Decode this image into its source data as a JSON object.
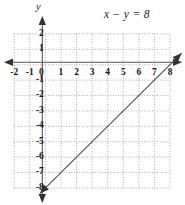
{
  "figure": {
    "equation_label": "x − y = 8",
    "equation_parts": {
      "lhs_x": "x",
      "operator": "−",
      "lhs_y": "y",
      "equals": "=",
      "rhs": "8"
    },
    "y_axis_name": "y",
    "x_axis_name": ""
  },
  "chart_data": {
    "type": "line",
    "title": "",
    "subtitle": "",
    "xlabel": "",
    "ylabel": "y",
    "annotations": [
      "x − y = 8"
    ],
    "legend": [],
    "legend_position": "none",
    "grid": true,
    "grid_style": "dotted",
    "xlim": [
      -2,
      8
    ],
    "ylim": [
      -8,
      2
    ],
    "xticks": [
      -2,
      -1,
      0,
      1,
      2,
      3,
      4,
      5,
      6,
      7,
      8
    ],
    "xtick_labels": [
      "-2",
      "-1",
      "0",
      "1",
      "2",
      "3",
      "4",
      "5",
      "6",
      "7",
      "8"
    ],
    "yticks": [
      2,
      1,
      -1,
      -2,
      -3,
      -4,
      -5,
      -6,
      -7,
      -8
    ],
    "ytick_labels": [
      "2",
      "1",
      "-1",
      "-2",
      "-3",
      "-4",
      "-5",
      "-6",
      "-7",
      "-8"
    ],
    "origin_label": "0",
    "series": [
      {
        "name": "x - y = 8",
        "equation": "x - y = 8",
        "slope": 1,
        "y_intercept": -8,
        "x_intercept": 8,
        "points": [
          [
            0,
            -8
          ],
          [
            8,
            0
          ]
        ],
        "arrows": "both",
        "color": "#4a4a4a"
      }
    ],
    "axis_color": "#555555",
    "grid_color": "#999999",
    "axis_arrows": [
      "left",
      "right",
      "up",
      "down"
    ]
  }
}
